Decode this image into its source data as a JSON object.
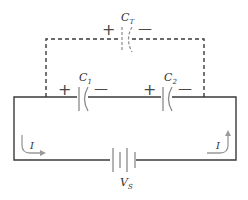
{
  "diagram": {
    "type": "circuit-schematic",
    "colors": {
      "wire": "#3a3a3a",
      "component": "#8a8a8a",
      "arrow": "#9a9a9a",
      "label": "#333333"
    },
    "components": {
      "ct": {
        "name": "C",
        "sub": "T",
        "plus": "+",
        "minus": "—"
      },
      "c1": {
        "name": "C",
        "sub": "1",
        "plus": "+",
        "minus": "—"
      },
      "c2": {
        "name": "C",
        "sub": "2",
        "plus": "+",
        "minus": "—"
      },
      "source": {
        "name": "V",
        "sub": "S"
      }
    },
    "currents": {
      "left": {
        "label": "I"
      },
      "right": {
        "label": "I"
      }
    }
  }
}
